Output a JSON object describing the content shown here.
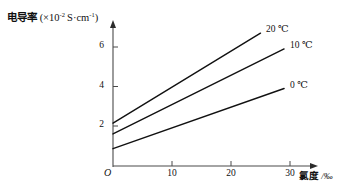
{
  "chart_data": {
    "type": "line",
    "title": "",
    "ylabel_cn": "电导率",
    "ylabel_units": "(×10",
    "ylabel_exp": "-2",
    "ylabel_units2": " S·cm",
    "ylabel_exp2": "-1",
    "ylabel_close": ")",
    "ylabel_full": "电导率 (×10⁻² S·cm⁻¹)",
    "xlabel_cn": "氯度",
    "xlabel_unit": " /‰",
    "xlabel_full": "氯度 /‰",
    "origin_label": "O",
    "xlim": [
      0,
      33
    ],
    "ylim": [
      0,
      7
    ],
    "xticks": [
      10,
      20,
      30
    ],
    "xtick_labels": [
      "10",
      "20",
      "30"
    ],
    "yticks": [
      2,
      4,
      6
    ],
    "ytick_labels": [
      "2",
      "4",
      "6"
    ],
    "grid": false,
    "legend_position": "inline-right-end-of-line",
    "line_color": "#111111",
    "axis_color": "#444444",
    "series": [
      {
        "name": "20 ℃",
        "label": "20 ℃",
        "x": [
          0,
          25
        ],
        "values": [
          2.15,
          6.7
        ],
        "label_x": 267,
        "label_y": 25
      },
      {
        "name": "10 ℃",
        "label": "10 ℃",
        "x": [
          0,
          29
        ],
        "values": [
          1.6,
          5.9
        ],
        "label_x": 291,
        "label_y": 40
      },
      {
        "name": "0 ℃",
        "label": "0 ℃",
        "x": [
          0,
          29
        ],
        "values": [
          0.85,
          3.9
        ],
        "label_x": 291,
        "label_y": 81
      }
    ]
  }
}
